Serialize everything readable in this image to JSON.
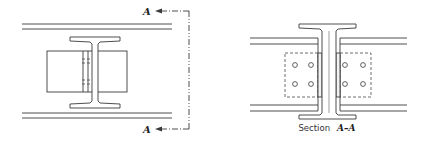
{
  "figure": {
    "left_view": {
      "name": "Beam-to-column splice elevation",
      "section_marker": {
        "top_label": "A",
        "bottom_label": "A"
      }
    },
    "right_view": {
      "name": "Section view",
      "caption_prefix": "Section",
      "caption_section": "A–A",
      "bolt_rows": 2,
      "bolt_columns_per_side": 2
    },
    "colors": {
      "line": "#3a3a3a",
      "background": "#ffffff"
    }
  }
}
